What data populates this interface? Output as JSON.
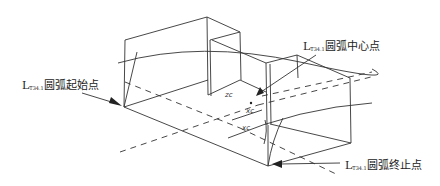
{
  "figure": {
    "type": "3D wireframe of stepped block with arc",
    "labels": {
      "start": {
        "prefix": "L",
        "subscript": "T34.1",
        "text": "圆弧起始点"
      },
      "center": {
        "prefix": "L",
        "subscript": "T34.1",
        "text": "圆弧中心点"
      },
      "end": {
        "prefix": "L",
        "subscript": "T34.1",
        "text": "圆弧终止点"
      }
    },
    "axis_marks": {
      "zc": "zc",
      "xc1": "xc",
      "xc2": "xc"
    },
    "colors": {
      "line": "#333333",
      "background": "#ffffff"
    }
  }
}
